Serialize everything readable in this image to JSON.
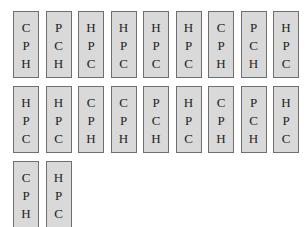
{
  "cards": [
    {
      "letters": [
        "C",
        "P",
        "H"
      ]
    },
    {
      "letters": [
        "P",
        "C",
        "H"
      ]
    },
    {
      "letters": [
        "H",
        "P",
        "C"
      ]
    },
    {
      "letters": [
        "H",
        "P",
        "C"
      ]
    },
    {
      "letters": [
        "H",
        "P",
        "C"
      ]
    },
    {
      "letters": [
        "H",
        "P",
        "C"
      ]
    },
    {
      "letters": [
        "C",
        "P",
        "H"
      ]
    },
    {
      "letters": [
        "P",
        "C",
        "H"
      ]
    },
    {
      "letters": [
        "H",
        "P",
        "C"
      ]
    },
    {
      "letters": [
        "H",
        "P",
        "C"
      ]
    },
    {
      "letters": [
        "H",
        "P",
        "C"
      ]
    },
    {
      "letters": [
        "C",
        "P",
        "H"
      ]
    },
    {
      "letters": [
        "C",
        "P",
        "H"
      ]
    },
    {
      "letters": [
        "P",
        "C",
        "H"
      ]
    },
    {
      "letters": [
        "H",
        "P",
        "C"
      ]
    },
    {
      "letters": [
        "C",
        "P",
        "H"
      ]
    },
    {
      "letters": [
        "P",
        "C",
        "H"
      ]
    },
    {
      "letters": [
        "H",
        "P",
        "C"
      ]
    },
    {
      "letters": [
        "C",
        "P",
        "H"
      ]
    },
    {
      "letters": [
        "H",
        "P",
        "C"
      ]
    }
  ],
  "layout": {
    "per_row": 9
  },
  "colors": {
    "card_fill": "#d9d9d9",
    "card_border": "#6f6f6f",
    "text": "#222222"
  }
}
